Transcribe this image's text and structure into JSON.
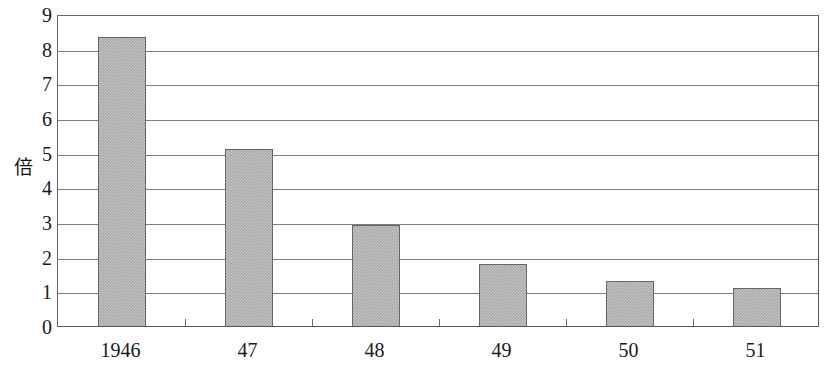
{
  "chart_data": {
    "type": "bar",
    "title": "",
    "xlabel": "",
    "ylabel": "倍",
    "categories": [
      "1946",
      "47",
      "48",
      "49",
      "50",
      "51"
    ],
    "values": [
      8.35,
      5.1,
      2.9,
      1.8,
      1.3,
      1.1
    ],
    "ylim": [
      0,
      9
    ],
    "y_ticks": [
      "0",
      "1",
      "2",
      "3",
      "4",
      "5",
      "6",
      "7",
      "8",
      "9"
    ],
    "grid": true,
    "legend": "none",
    "series": [
      {
        "name": "",
        "values": [
          8.35,
          5.1,
          2.9,
          1.8,
          1.3,
          1.1
        ]
      }
    ],
    "colors": {
      "bar_fill": "#a9a9a9",
      "bar_border": "#666666",
      "gridline": "#7d7d7d",
      "axis": "#555555",
      "text": "#1a1a1a",
      "background": "#ffffff"
    }
  }
}
